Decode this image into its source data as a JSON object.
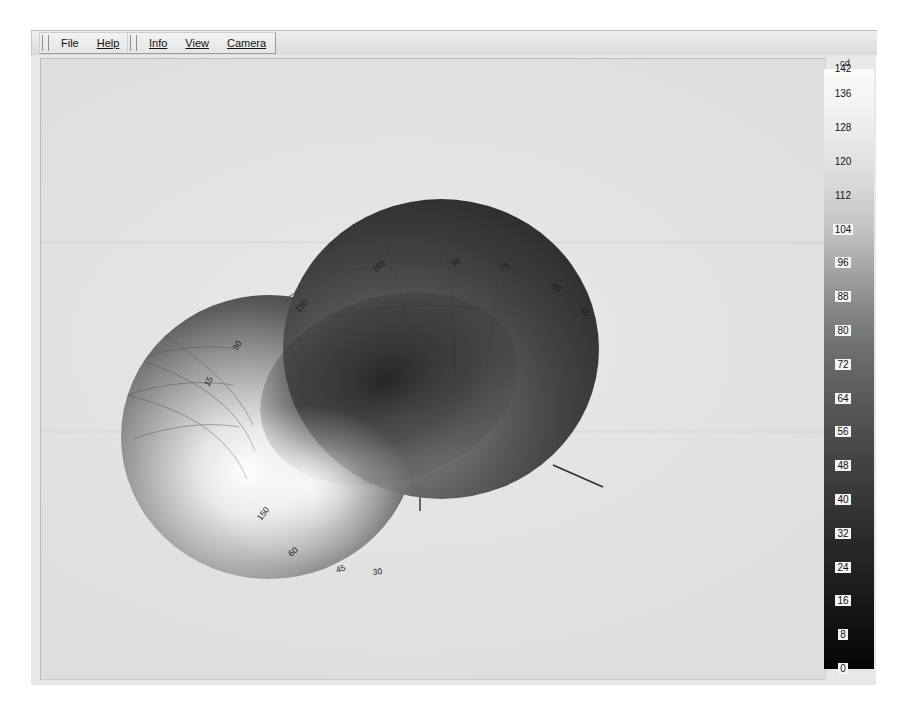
{
  "window": {
    "title": "Photometric Distribution Viewer"
  },
  "toolbars": [
    {
      "name": "file-toolbar",
      "items": [
        {
          "label": "File",
          "mnemonic": ""
        },
        {
          "label": "Help",
          "mnemonic": "H"
        }
      ]
    },
    {
      "name": "view-toolbar",
      "items": [
        {
          "label": "Info",
          "mnemonic": "I"
        },
        {
          "label": "View",
          "mnemonic": "V"
        },
        {
          "label": "Camera",
          "mnemonic": "C"
        }
      ]
    }
  ],
  "colorbar": {
    "unit": "cd",
    "min": 0,
    "max": 142,
    "ticks": [
      142,
      136,
      128,
      120,
      112,
      104,
      96,
      88,
      80,
      72,
      64,
      56,
      48,
      40,
      32,
      24,
      16,
      8,
      0
    ],
    "gradient_top_color": "#fbfbfb",
    "gradient_bottom_color": "#050505"
  },
  "plot": {
    "axis_labels": {
      "vertical": "Z",
      "lateral": "X"
    },
    "angle_labels_upper": [
      "165",
      "150",
      "90",
      "75",
      "60",
      "45",
      "30",
      "15"
    ],
    "angle_labels_lower": [
      "150",
      "60",
      "45",
      "30"
    ],
    "surface_description": "bilobed luminous intensity distribution",
    "background_color": "#e4e4e4",
    "surface_dark_color": "#3a3a3a",
    "surface_light_color": "#f2f2f2",
    "grid_line_color": "#5a5a5a"
  },
  "chart_data": {
    "type": "line",
    "xlabel": "Polar angle (degrees)",
    "ylabel": "Luminous intensity (cd)",
    "ylim": [
      0,
      142
    ],
    "legend": [
      "cd"
    ],
    "categories": [
      "0",
      "15",
      "30",
      "45",
      "60",
      "75",
      "90",
      "105",
      "120",
      "135",
      "150",
      "165",
      "180"
    ],
    "series": [
      {
        "name": "C0 plane",
        "values": [
          142,
          138,
          128,
          112,
          92,
          68,
          40,
          66,
          90,
          110,
          126,
          136,
          140
        ]
      },
      {
        "name": "C90 plane",
        "values": [
          138,
          134,
          124,
          108,
          88,
          64,
          36,
          62,
          86,
          106,
          122,
          132,
          136
        ]
      }
    ]
  }
}
